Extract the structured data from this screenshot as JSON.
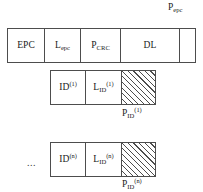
{
  "diagram": {
    "background_color": "#ffffff",
    "line_color": "#4d4d4d",
    "text_color": "#1a1a1a",
    "rows": [
      {
        "name": "epc-frame-row",
        "cells": [
          {
            "name": "epc-field",
            "text": "EPC"
          },
          {
            "name": "lepc-field",
            "text": "Lepc",
            "base": "L",
            "sub": "epc"
          },
          {
            "name": "pcrc-field",
            "text": "PCRC",
            "base": "P",
            "sub": "CRC"
          },
          {
            "name": "dl-field",
            "text": "DL"
          },
          {
            "name": "pepc-field",
            "text": ""
          }
        ],
        "callout": {
          "name": "pepc-label",
          "text": "Pepc",
          "base": "P",
          "sub": "epc"
        }
      },
      {
        "name": "id-1-row",
        "cells": [
          {
            "name": "id-1-field",
            "text": "ID(1)",
            "base": "ID",
            "sup": "(1)"
          },
          {
            "name": "lid-1-field",
            "text": "LID(1)",
            "base": "L",
            "sub": "ID",
            "sup": "(1)"
          },
          {
            "name": "pid-1-field",
            "text": "",
            "hatched": true
          }
        ],
        "callout": {
          "name": "pid-1-label",
          "text": "PID(1)",
          "base": "P",
          "sub": "ID",
          "sup": "(1)"
        }
      },
      {
        "name": "id-n-row",
        "prefix": "...",
        "cells": [
          {
            "name": "id-n-field",
            "text": "ID(n)",
            "base": "ID",
            "sup": "(n)"
          },
          {
            "name": "lid-n-field",
            "text": "LID(n)",
            "base": "L",
            "sub": "ID",
            "sup": "(n)"
          },
          {
            "name": "pid-n-field",
            "text": "",
            "hatched": true
          }
        ],
        "callout": {
          "name": "pid-n-label",
          "text": "PID(n)",
          "base": "P",
          "sub": "ID",
          "sup": "(n)"
        }
      }
    ]
  }
}
